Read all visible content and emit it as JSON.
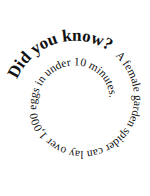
{
  "fact": {
    "heading": "Did you know?",
    "body": "A female garden spider can lay over 1,000 eggs in under 10 minutes."
  },
  "colors": {
    "background": "#ffffff",
    "text": "#111111"
  }
}
